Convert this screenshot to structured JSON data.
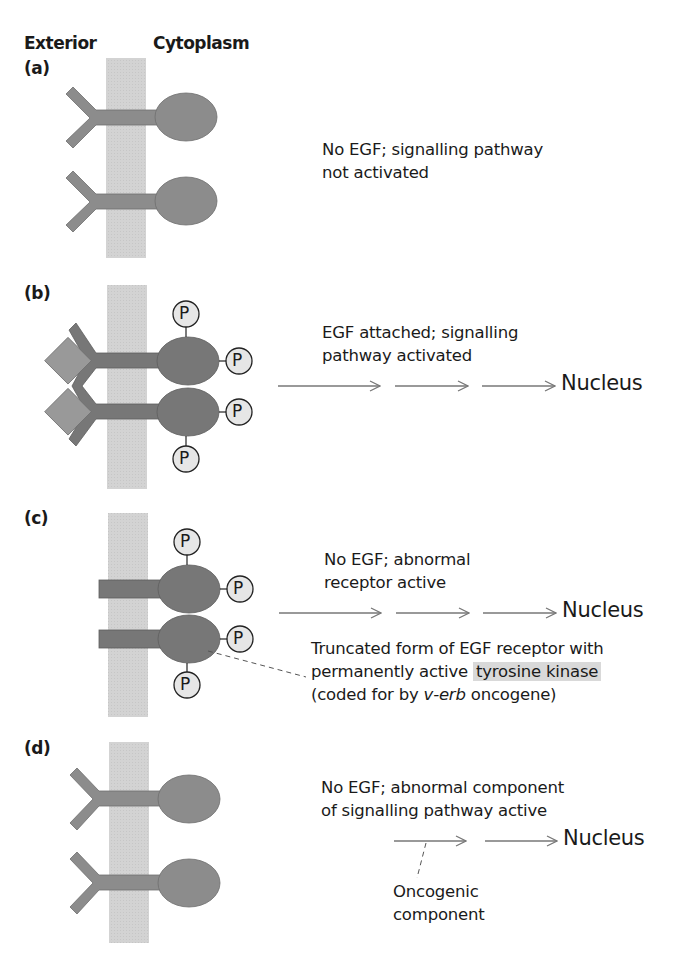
{
  "headers": {
    "exterior": "Exterior",
    "cytoplasm": "Cytoplasm"
  },
  "panels": [
    {
      "label": "(a)",
      "caption_lines": [
        "No EGF; signalling pathway",
        "not activated"
      ]
    },
    {
      "label": "(b)",
      "caption_lines": [
        "EGF attached; signalling",
        "pathway activated"
      ],
      "destination": "Nucleus"
    },
    {
      "label": "(c)",
      "caption_lines": [
        "No EGF; abnormal",
        "receptor active"
      ],
      "destination": "Nucleus",
      "annotation": {
        "line1": "Truncated form of EGF receptor with",
        "line2_pre": "permanently active ",
        "line2_highlight": "tyrosine kinase",
        "line3_pre": "(coded for by ",
        "line3_italic": "v-erb",
        "line3_post": " oncogene)"
      }
    },
    {
      "label": "(d)",
      "caption_lines": [
        "No EGF; abnormal component",
        "of signalling pathway active"
      ],
      "destination": "Nucleus",
      "annotation": {
        "line1": "Oncogenic",
        "line2": "component"
      }
    }
  ],
  "phosphate_label": "P",
  "colors": {
    "membrane": "#d3d3d3",
    "receptor_inactive": "#8c8c8c",
    "receptor_active": "#777777",
    "egf": "#999999",
    "phosphate_fill": "#e6e6e6",
    "arrow": "#777777",
    "highlight": "#d9d9d9"
  }
}
